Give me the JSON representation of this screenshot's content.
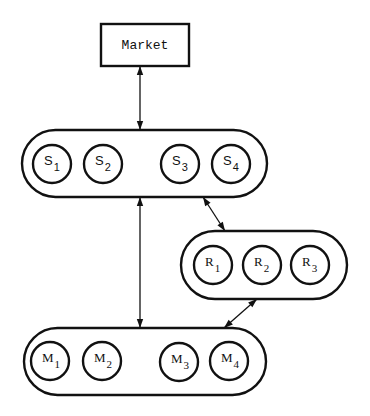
{
  "diagram": {
    "market": {
      "label": "Market",
      "x": 101,
      "y": 24,
      "w": 88,
      "h": 42
    },
    "groups": [
      {
        "id": "S",
        "pill": {
          "x": 22,
          "y": 130,
          "w": 245,
          "h": 67
        },
        "font": "sans",
        "nodes": [
          {
            "letter": "S",
            "sub": "1",
            "cx": 52,
            "cy": 164
          },
          {
            "letter": "S",
            "sub": "2",
            "cx": 103,
            "cy": 164
          },
          {
            "letter": "S",
            "sub": "3",
            "cx": 180,
            "cy": 164
          },
          {
            "letter": "S",
            "sub": "4",
            "cx": 231,
            "cy": 164
          }
        ]
      },
      {
        "id": "R",
        "pill": {
          "x": 181,
          "y": 231,
          "w": 166,
          "h": 68
        },
        "font": "serif",
        "nodes": [
          {
            "letter": "R",
            "sub": "1",
            "cx": 213,
            "cy": 265
          },
          {
            "letter": "R",
            "sub": "2",
            "cx": 262,
            "cy": 265
          },
          {
            "letter": "R",
            "sub": "3",
            "cx": 310,
            "cy": 265
          }
        ]
      },
      {
        "id": "M",
        "pill": {
          "x": 24,
          "y": 328,
          "w": 242,
          "h": 67
        },
        "font": "serif",
        "nodes": [
          {
            "letter": "M",
            "sub": "1",
            "cx": 50,
            "cy": 361
          },
          {
            "letter": "M",
            "sub": "2",
            "cx": 102,
            "cy": 361
          },
          {
            "letter": "M",
            "sub": "3",
            "cx": 179,
            "cy": 362
          },
          {
            "letter": "M",
            "sub": "4",
            "cx": 229,
            "cy": 361
          }
        ]
      }
    ],
    "node_radius": 19,
    "links": [
      {
        "id": "market-S",
        "x1": 140,
        "y1": 66,
        "x2": 140,
        "y2": 130,
        "bidirectional": true
      },
      {
        "id": "S-M",
        "x1": 140,
        "y1": 197,
        "x2": 140,
        "y2": 328,
        "bidirectional": true
      },
      {
        "id": "S-R",
        "x1": 203,
        "y1": 197,
        "x2": 225,
        "y2": 231,
        "bidirectional": true
      },
      {
        "id": "R-M",
        "x1": 257,
        "y1": 299,
        "x2": 224,
        "y2": 328,
        "bidirectional": true
      }
    ],
    "colors": {
      "stroke": "#111111",
      "background": "#ffffff"
    }
  }
}
